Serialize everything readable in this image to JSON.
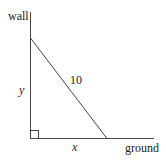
{
  "diagram": {
    "type": "ladder-against-wall",
    "labels": {
      "wall": "wall",
      "ground": "ground",
      "height": "y",
      "base": "x",
      "ladder_length": "10"
    },
    "right_angle_marker": true,
    "colors": {
      "line": "#444444",
      "text": "#222222",
      "background": "#ffffff"
    }
  }
}
